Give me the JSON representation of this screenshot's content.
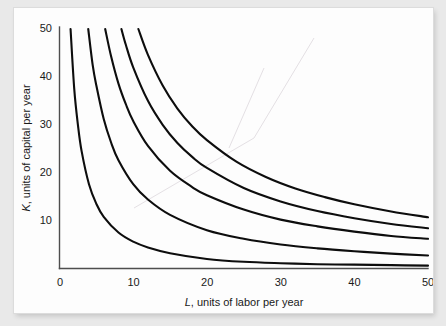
{
  "figure": {
    "caption": "",
    "background_color": "#e9e9e9",
    "panel_color": "#fdfdfd",
    "curve_color": "#0d0d0d",
    "axis_color": "#4e4e4e"
  },
  "axes": {
    "x_title_var": "L",
    "x_title_rest": ", units of labor per year",
    "y_title_var": "K",
    "y_title_rest": ", units of capital per year",
    "x_ticks": [
      "0",
      "10",
      "20",
      "30",
      "40",
      "50"
    ],
    "y_ticks": [
      "10",
      "20",
      "30",
      "40",
      "50"
    ]
  },
  "chart_data": {
    "type": "line",
    "title": "",
    "subtitle": "",
    "xlabel": "L, units of labor per year",
    "ylabel": "K, units of capital per year",
    "xlim": [
      0,
      50
    ],
    "ylim": [
      0,
      50
    ],
    "xticks": [
      0,
      10,
      20,
      30,
      40,
      50
    ],
    "yticks": [
      0,
      10,
      20,
      30,
      40,
      50
    ],
    "grid": false,
    "legend": "none",
    "annotations": [],
    "series": [
      {
        "name": "isoquant-1",
        "x": [
          1.5,
          2,
          2.5,
          3,
          4,
          5,
          6,
          8,
          10,
          12,
          15,
          20,
          25,
          30,
          35,
          40,
          45,
          50
        ],
        "values": [
          50,
          37.5,
          30,
          24.5,
          17.6,
          13.5,
          10.8,
          7.5,
          5.6,
          4.4,
          3.2,
          2.0,
          1.4,
          1.1,
          0.9,
          0.8,
          0.7,
          0.6
        ]
      },
      {
        "name": "isoquant-2",
        "x": [
          3.9,
          4.5,
          5,
          6,
          7,
          8,
          10,
          12,
          15,
          20,
          25,
          30,
          35,
          40,
          45,
          50
        ],
        "values": [
          50,
          42.5,
          38.2,
          31.2,
          26.3,
          22.6,
          17.6,
          14.4,
          11.2,
          8.0,
          6.2,
          5.0,
          4.2,
          3.6,
          3.1,
          2.7
        ]
      },
      {
        "name": "isoquant-3",
        "x": [
          6.2,
          7,
          8,
          9,
          10,
          12,
          15,
          18,
          20,
          25,
          30,
          35,
          40,
          45,
          50
        ],
        "values": [
          50,
          44.3,
          38.6,
          34.3,
          30.8,
          25.6,
          20.4,
          17.0,
          15.3,
          12.3,
          10.2,
          8.8,
          7.7,
          6.8,
          6.2
        ]
      },
      {
        "name": "isoquant-4",
        "x": [
          8.4,
          9,
          10,
          12,
          14,
          16,
          18,
          20,
          25,
          30,
          35,
          40,
          45,
          50
        ],
        "values": [
          50,
          46.7,
          42.0,
          35.0,
          30.0,
          26.2,
          23.3,
          21.0,
          16.8,
          14.0,
          12.0,
          10.5,
          9.3,
          8.4
        ]
      },
      {
        "name": "isoquant-5",
        "x": [
          10.7,
          12,
          14,
          16,
          18,
          20,
          24,
          28,
          32,
          36,
          40,
          45,
          50
        ],
        "values": [
          50,
          44.6,
          38.2,
          33.4,
          29.7,
          26.8,
          22.3,
          19.1,
          16.7,
          14.9,
          13.4,
          11.9,
          10.7
        ]
      }
    ]
  }
}
